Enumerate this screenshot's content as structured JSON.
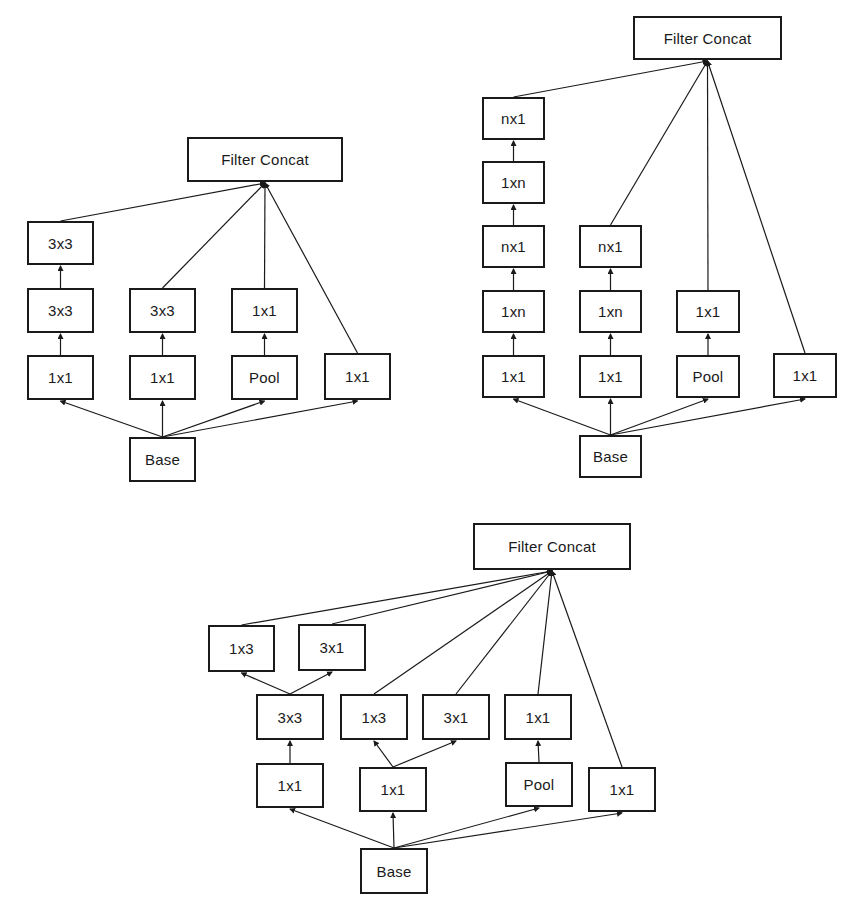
{
  "colors": {
    "stroke": "#1a1a1a",
    "background": "#ffffff",
    "text": "#1a1a1a"
  },
  "diagrams": [
    {
      "name": "inception-module-a",
      "nodes": [
        {
          "id": "concat",
          "label": "Filter Concat",
          "x": 187,
          "y": 137,
          "w": 156,
          "h": 45
        },
        {
          "id": "b1_3x3b",
          "label": "3x3",
          "x": 27,
          "y": 221,
          "w": 67,
          "h": 44
        },
        {
          "id": "b1_3x3a",
          "label": "3x3",
          "x": 27,
          "y": 288,
          "w": 67,
          "h": 45
        },
        {
          "id": "b1_1x1",
          "label": "1x1",
          "x": 27,
          "y": 355,
          "w": 67,
          "h": 45
        },
        {
          "id": "b2_3x3",
          "label": "3x3",
          "x": 129,
          "y": 288,
          "w": 67,
          "h": 45
        },
        {
          "id": "b2_1x1",
          "label": "1x1",
          "x": 129,
          "y": 355,
          "w": 67,
          "h": 45
        },
        {
          "id": "b3_1x1",
          "label": "1x1",
          "x": 231,
          "y": 288,
          "w": 67,
          "h": 45
        },
        {
          "id": "b3_pool",
          "label": "Pool",
          "x": 231,
          "y": 355,
          "w": 67,
          "h": 45
        },
        {
          "id": "b4_1x1",
          "label": "1x1",
          "x": 324,
          "y": 353,
          "w": 67,
          "h": 47
        },
        {
          "id": "base",
          "label": "Base",
          "x": 129,
          "y": 437,
          "w": 67,
          "h": 45
        }
      ],
      "edges": [
        [
          "base",
          "b1_1x1"
        ],
        [
          "base",
          "b2_1x1"
        ],
        [
          "base",
          "b3_pool"
        ],
        [
          "base",
          "b4_1x1"
        ],
        [
          "b1_1x1",
          "b1_3x3a"
        ],
        [
          "b1_3x3a",
          "b1_3x3b"
        ],
        [
          "b2_1x1",
          "b2_3x3"
        ],
        [
          "b3_pool",
          "b3_1x1"
        ],
        [
          "b1_3x3b",
          "concat"
        ],
        [
          "b2_3x3",
          "concat"
        ],
        [
          "b3_1x1",
          "concat"
        ],
        [
          "b4_1x1",
          "concat"
        ]
      ]
    },
    {
      "name": "inception-module-b",
      "nodes": [
        {
          "id": "concat",
          "label": "Filter Concat",
          "x": 633,
          "y": 16,
          "w": 149,
          "h": 44
        },
        {
          "id": "b1_nx1b",
          "label": "nx1",
          "x": 482,
          "y": 97,
          "w": 63,
          "h": 43
        },
        {
          "id": "b1_1xnb",
          "label": "1xn",
          "x": 482,
          "y": 161,
          "w": 63,
          "h": 43
        },
        {
          "id": "b1_nx1a",
          "label": "nx1",
          "x": 482,
          "y": 225,
          "w": 63,
          "h": 43
        },
        {
          "id": "b1_1xna",
          "label": "1xn",
          "x": 482,
          "y": 290,
          "w": 63,
          "h": 43
        },
        {
          "id": "b1_1x1",
          "label": "1x1",
          "x": 482,
          "y": 355,
          "w": 63,
          "h": 43
        },
        {
          "id": "b2_nx1",
          "label": "nx1",
          "x": 579,
          "y": 225,
          "w": 63,
          "h": 43
        },
        {
          "id": "b2_1xn",
          "label": "1xn",
          "x": 579,
          "y": 290,
          "w": 63,
          "h": 43
        },
        {
          "id": "b2_1x1",
          "label": "1x1",
          "x": 579,
          "y": 355,
          "w": 63,
          "h": 43
        },
        {
          "id": "b3_1x1",
          "label": "1x1",
          "x": 676,
          "y": 290,
          "w": 64,
          "h": 43
        },
        {
          "id": "b3_pool",
          "label": "Pool",
          "x": 676,
          "y": 355,
          "w": 64,
          "h": 43
        },
        {
          "id": "b4_1x1",
          "label": "1x1",
          "x": 773,
          "y": 353,
          "w": 64,
          "h": 45
        },
        {
          "id": "base",
          "label": "Base",
          "x": 579,
          "y": 435,
          "w": 63,
          "h": 43
        }
      ],
      "edges": [
        [
          "base",
          "b1_1x1"
        ],
        [
          "base",
          "b2_1x1"
        ],
        [
          "base",
          "b3_pool"
        ],
        [
          "base",
          "b4_1x1"
        ],
        [
          "b1_1x1",
          "b1_1xna"
        ],
        [
          "b1_1xna",
          "b1_nx1a"
        ],
        [
          "b1_nx1a",
          "b1_1xnb"
        ],
        [
          "b1_1xnb",
          "b1_nx1b"
        ],
        [
          "b2_1x1",
          "b2_1xn"
        ],
        [
          "b2_1xn",
          "b2_nx1"
        ],
        [
          "b3_pool",
          "b3_1x1"
        ],
        [
          "b1_nx1b",
          "concat"
        ],
        [
          "b2_nx1",
          "concat"
        ],
        [
          "b3_1x1",
          "concat"
        ],
        [
          "b4_1x1",
          "concat"
        ]
      ]
    },
    {
      "name": "inception-module-c",
      "nodes": [
        {
          "id": "concat",
          "label": "Filter Concat",
          "x": 473,
          "y": 523,
          "w": 158,
          "h": 47
        },
        {
          "id": "b1_1x3",
          "label": "1x3",
          "x": 208,
          "y": 625,
          "w": 67,
          "h": 47
        },
        {
          "id": "b1_3x1",
          "label": "3x1",
          "x": 298,
          "y": 624,
          "w": 68,
          "h": 47
        },
        {
          "id": "b1_3x3",
          "label": "3x3",
          "x": 256,
          "y": 694,
          "w": 68,
          "h": 46
        },
        {
          "id": "b2_1x3",
          "label": "1x3",
          "x": 340,
          "y": 694,
          "w": 68,
          "h": 46
        },
        {
          "id": "b2_3x1",
          "label": "3x1",
          "x": 422,
          "y": 694,
          "w": 68,
          "h": 46
        },
        {
          "id": "b3_1x1",
          "label": "1x1",
          "x": 504,
          "y": 694,
          "w": 68,
          "h": 46
        },
        {
          "id": "b1_1x1",
          "label": "1x1",
          "x": 256,
          "y": 763,
          "w": 68,
          "h": 45
        },
        {
          "id": "b2_1x1",
          "label": "1x1",
          "x": 359,
          "y": 767,
          "w": 68,
          "h": 45
        },
        {
          "id": "b3_pool",
          "label": "Pool",
          "x": 505,
          "y": 762,
          "w": 68,
          "h": 45
        },
        {
          "id": "b4_1x1",
          "label": "1x1",
          "x": 588,
          "y": 767,
          "w": 68,
          "h": 45
        },
        {
          "id": "base",
          "label": "Base",
          "x": 360,
          "y": 848,
          "w": 68,
          "h": 46
        }
      ],
      "edges": [
        [
          "base",
          "b1_1x1"
        ],
        [
          "base",
          "b2_1x1"
        ],
        [
          "base",
          "b3_pool"
        ],
        [
          "base",
          "b4_1x1"
        ],
        [
          "b1_1x1",
          "b1_3x3"
        ],
        [
          "b1_3x3",
          "b1_1x3"
        ],
        [
          "b1_3x3",
          "b1_3x1"
        ],
        [
          "b2_1x1",
          "b2_1x3"
        ],
        [
          "b2_1x1",
          "b2_3x1"
        ],
        [
          "b3_pool",
          "b3_1x1"
        ],
        [
          "b1_1x3",
          "concat"
        ],
        [
          "b1_3x1",
          "concat"
        ],
        [
          "b2_1x3",
          "concat"
        ],
        [
          "b2_3x1",
          "concat"
        ],
        [
          "b3_1x1",
          "concat"
        ],
        [
          "b4_1x1",
          "concat"
        ]
      ]
    }
  ]
}
